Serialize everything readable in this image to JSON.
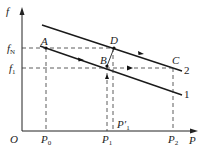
{
  "diagram": {
    "axes": {
      "y_label": "f",
      "x_label": "P",
      "origin_label": "O"
    },
    "y_ticks": [
      {
        "main": "f",
        "sub": "N"
      },
      {
        "main": "f",
        "sub": "1"
      }
    ],
    "x_ticks": [
      {
        "main": "P",
        "sub": "0"
      },
      {
        "main": "P",
        "sub": "1"
      },
      {
        "main": "P′",
        "sub": "1"
      },
      {
        "main": "P",
        "sub": "2"
      }
    ],
    "points": {
      "A": "A",
      "B": "B",
      "C": "C",
      "D": "D"
    },
    "curves": {
      "upper": "2",
      "lower": "1"
    },
    "colors": {
      "line": "#1a1a1a",
      "dashed": "#333333"
    }
  }
}
